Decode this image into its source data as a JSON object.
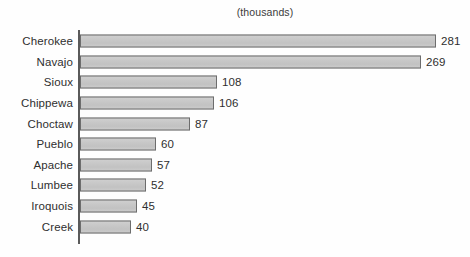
{
  "chart_data": {
    "type": "bar",
    "orientation": "horizontal",
    "title": "(thousands)",
    "xlabel": "",
    "ylabel": "",
    "grid": false,
    "legend": null,
    "xlim": [
      0,
      310
    ],
    "categories": [
      "Cherokee",
      "Navajo",
      "Sioux",
      "Chippewa",
      "Choctaw",
      "Pueblo",
      "Apache",
      "Lumbee",
      "Iroquois",
      "Creek"
    ],
    "values": [
      281,
      269,
      108,
      106,
      87,
      60,
      57,
      52,
      45,
      40
    ],
    "value_labels": [
      "281",
      "269",
      "108",
      "106",
      "87",
      "60",
      "57",
      "52",
      "45",
      "40"
    ],
    "units": "thousands",
    "bars": [
      {
        "label": "Cherokee",
        "value": 281,
        "value_label": "281"
      },
      {
        "label": "Navajo",
        "value": 269,
        "value_label": "269"
      },
      {
        "label": "Sioux",
        "value": 108,
        "value_label": "108"
      },
      {
        "label": "Chippewa",
        "value": 106,
        "value_label": "106"
      },
      {
        "label": "Choctaw",
        "value": 87,
        "value_label": "87"
      },
      {
        "label": "Pueblo",
        "value": 60,
        "value_label": "60"
      },
      {
        "label": "Apache",
        "value": 57,
        "value_label": "57"
      },
      {
        "label": "Lumbee",
        "value": 52,
        "value_label": "52"
      },
      {
        "label": "Iroquois",
        "value": 45,
        "value_label": "45"
      },
      {
        "label": "Creek",
        "value": 40,
        "value_label": "40"
      }
    ],
    "colors": {
      "bar_fill": "#c9c9c9",
      "bar_stroke": "#6d6d6d",
      "axis": "#5a5a5a",
      "text": "#2f2f2f",
      "background": "#fefefe"
    }
  }
}
